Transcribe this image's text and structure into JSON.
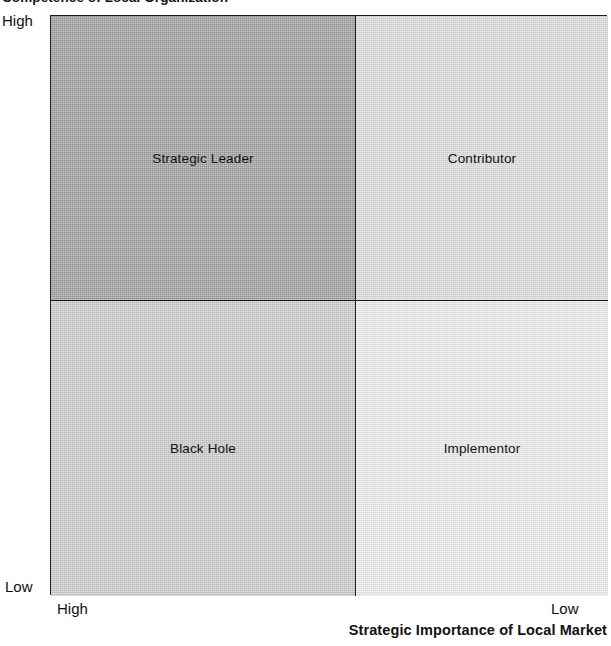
{
  "chart_data": {
    "type": "table",
    "title": "Competence of Local Organization",
    "ylabel": "Competence of Local Organization",
    "xlabel": "Strategic Importance of Local Market",
    "y_axis": {
      "top_label": "High",
      "bottom_label": "Low"
    },
    "x_axis": {
      "left_label": "High",
      "right_label": "Low"
    },
    "grid": false,
    "legend": "none",
    "quadrants": [
      {
        "id": "strategic-leader",
        "label": "Strategic Leader",
        "position": "top-left",
        "competence": "High",
        "strategic_importance": "High",
        "fill": "#9c9c9c"
      },
      {
        "id": "contributor",
        "label": "Contributor",
        "position": "top-right",
        "competence": "High",
        "strategic_importance": "Low",
        "fill": "#dcdcdc"
      },
      {
        "id": "black-hole",
        "label": "Black Hole",
        "position": "bottom-left",
        "competence": "Low",
        "strategic_importance": "High",
        "fill": "#c9c9c9"
      },
      {
        "id": "implementor",
        "label": "Implementor",
        "position": "bottom-right",
        "competence": "Low",
        "strategic_importance": "Low",
        "fill": "#ececec"
      }
    ]
  },
  "axes": {
    "vertical_title": "Competence of Local Organization",
    "horizontal_title": "Strategic Importance of Local Market",
    "vertical_high": "High",
    "vertical_low": "Low",
    "horizontal_high": "High",
    "horizontal_low": "Low"
  },
  "colors": {
    "border": "#1a1a1a",
    "text": "#111111",
    "background": "#ffffff"
  }
}
